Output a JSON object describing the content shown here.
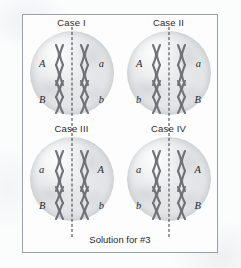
{
  "figure": {
    "caption": "Solution for #3",
    "frame_color": "#9aa0a6",
    "background_color": "#ffffff",
    "cell_fill_color": "#e2e4e6",
    "plate_line_color": "#3a3a3a",
    "chromosome_color": "#6f7377"
  },
  "cases": [
    {
      "label": "Case I",
      "pairs": {
        "upper": {
          "left_allele": "A",
          "right_allele": "a"
        },
        "lower": {
          "left_allele": "B",
          "right_allele": "b"
        }
      }
    },
    {
      "label": "Case II",
      "pairs": {
        "upper": {
          "left_allele": "A",
          "right_allele": "a"
        },
        "lower": {
          "left_allele": "b",
          "right_allele": "B"
        }
      }
    },
    {
      "label": "Case III",
      "pairs": {
        "upper": {
          "left_allele": "a",
          "right_allele": "A"
        },
        "lower": {
          "left_allele": "B",
          "right_allele": "b"
        }
      }
    },
    {
      "label": "Case IV",
      "pairs": {
        "upper": {
          "left_allele": "a",
          "right_allele": "A"
        },
        "lower": {
          "left_allele": "b",
          "right_allele": "B"
        }
      }
    }
  ]
}
